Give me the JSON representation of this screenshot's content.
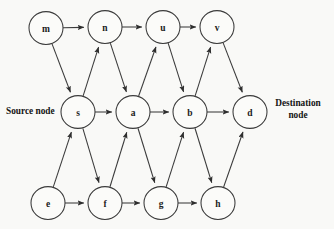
{
  "diagram": {
    "background_color": "#f9f9f7",
    "stroke_color": "#3a3a3a",
    "label_color": "#141414",
    "node_radius": 17,
    "annotations": {
      "source": "Source node",
      "destination_line1": "Destination",
      "destination_line2": "node"
    },
    "nodes": [
      {
        "id": "m",
        "label": "m",
        "x": 46,
        "y": 28,
        "row": "top"
      },
      {
        "id": "n",
        "label": "n",
        "x": 105,
        "y": 27,
        "row": "top"
      },
      {
        "id": "u",
        "label": "u",
        "x": 163,
        "y": 27,
        "row": "top"
      },
      {
        "id": "v",
        "label": "v",
        "x": 217,
        "y": 27,
        "row": "top"
      },
      {
        "id": "s",
        "label": "s",
        "x": 78,
        "y": 112,
        "row": "middle"
      },
      {
        "id": "a",
        "label": "a",
        "x": 133,
        "y": 112,
        "row": "middle"
      },
      {
        "id": "b",
        "label": "b",
        "x": 190,
        "y": 112,
        "row": "middle"
      },
      {
        "id": "d",
        "label": "d",
        "x": 250,
        "y": 112,
        "row": "middle"
      },
      {
        "id": "e",
        "label": "e",
        "x": 48,
        "y": 203,
        "row": "bottom"
      },
      {
        "id": "f",
        "label": "f",
        "x": 105,
        "y": 203,
        "row": "bottom"
      },
      {
        "id": "g",
        "label": "g",
        "x": 161,
        "y": 203,
        "row": "bottom"
      },
      {
        "id": "h",
        "label": "h",
        "x": 218,
        "y": 203,
        "row": "bottom"
      }
    ],
    "edges": [
      {
        "from": "m",
        "to": "n"
      },
      {
        "from": "n",
        "to": "u"
      },
      {
        "from": "u",
        "to": "v"
      },
      {
        "from": "m",
        "to": "s"
      },
      {
        "from": "s",
        "to": "n"
      },
      {
        "from": "n",
        "to": "a"
      },
      {
        "from": "a",
        "to": "u"
      },
      {
        "from": "u",
        "to": "b"
      },
      {
        "from": "b",
        "to": "v"
      },
      {
        "from": "v",
        "to": "d"
      },
      {
        "from": "s",
        "to": "a"
      },
      {
        "from": "a",
        "to": "b"
      },
      {
        "from": "b",
        "to": "d"
      },
      {
        "from": "e",
        "to": "s"
      },
      {
        "from": "s",
        "to": "f"
      },
      {
        "from": "f",
        "to": "a"
      },
      {
        "from": "a",
        "to": "g"
      },
      {
        "from": "g",
        "to": "b"
      },
      {
        "from": "b",
        "to": "h"
      },
      {
        "from": "h",
        "to": "d"
      },
      {
        "from": "e",
        "to": "f"
      },
      {
        "from": "f",
        "to": "g"
      },
      {
        "from": "g",
        "to": "h"
      }
    ],
    "source_label_pos": {
      "x": 6,
      "y": 114
    },
    "destination_label_pos": {
      "x": 298,
      "y": 106
    }
  }
}
